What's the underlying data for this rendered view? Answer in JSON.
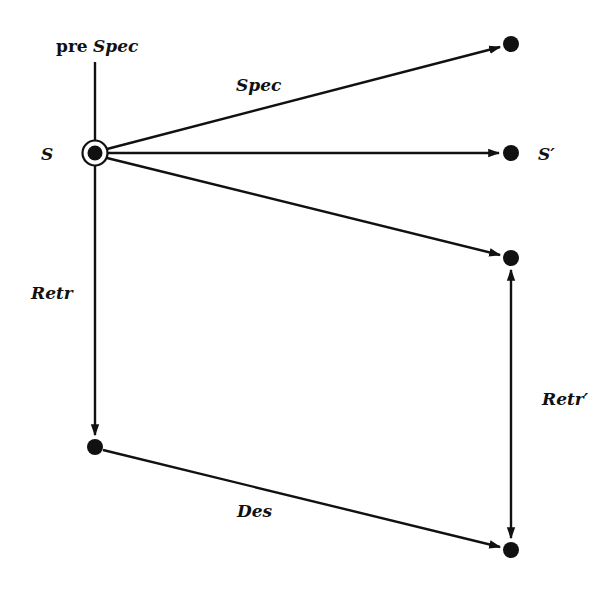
{
  "diagram": {
    "colors": {
      "ink": "#111111",
      "background": "#ffffff"
    },
    "nodes": [
      {
        "id": "S",
        "label": "S",
        "x": 95,
        "y": 153,
        "initial": true
      },
      {
        "id": "top_right",
        "label": "",
        "x": 511,
        "y": 44
      },
      {
        "id": "S_prime",
        "label": "S′",
        "x": 511,
        "y": 153
      },
      {
        "id": "mid_right",
        "label": "",
        "x": 511,
        "y": 258
      },
      {
        "id": "bottom_left",
        "label": "",
        "x": 95,
        "y": 447
      },
      {
        "id": "bottom_right",
        "label": "",
        "x": 511,
        "y": 550
      }
    ],
    "labels": {
      "pre_prefix": "pre",
      "pre_spec": "Spec",
      "spec": "Spec",
      "s": "S",
      "s_prime": "S′",
      "retr": "Retr",
      "retr_prime": "Retr′",
      "des": "Des"
    },
    "edges": [
      {
        "from": "pre",
        "to": "S",
        "label": "pre Spec",
        "arrow": "none"
      },
      {
        "from": "S",
        "to": "top_right",
        "label": "Spec",
        "arrow": "end"
      },
      {
        "from": "S",
        "to": "S_prime",
        "label": "",
        "arrow": "end"
      },
      {
        "from": "S",
        "to": "mid_right",
        "label": "",
        "arrow": "end"
      },
      {
        "from": "S",
        "to": "bottom_left",
        "label": "Retr",
        "arrow": "end"
      },
      {
        "from": "bottom_left",
        "to": "bottom_right",
        "label": "Des",
        "arrow": "end"
      },
      {
        "from": "bottom_right",
        "to": "mid_right",
        "label": "Retr′",
        "arrow": "both"
      }
    ]
  }
}
